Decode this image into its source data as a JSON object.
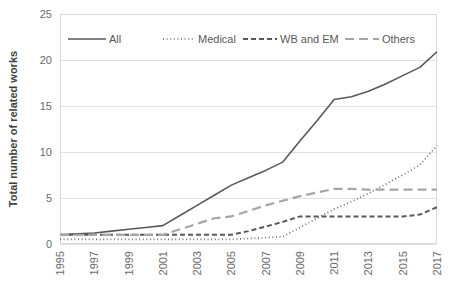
{
  "chart_data": {
    "type": "line",
    "title": "",
    "xlabel": "",
    "ylabel": "Total number of related works",
    "ylim": [
      0,
      25
    ],
    "yticks": [
      0,
      5,
      10,
      15,
      20,
      25
    ],
    "ytick_labels": [
      "0",
      "5",
      "10",
      "15",
      "20",
      "25"
    ],
    "grid": true,
    "legend_position": "top-inside",
    "x": [
      1995,
      1996,
      1997,
      1998,
      1999,
      2000,
      2001,
      2002,
      2003,
      2004,
      2005,
      2006,
      2007,
      2008,
      2009,
      2010,
      2011,
      2012,
      2013,
      2014,
      2015,
      2016,
      2017
    ],
    "xtick_labels": [
      "1995",
      "1997",
      "1999",
      "2001",
      "2003",
      "2005",
      "2007",
      "2009",
      "2011",
      "2013",
      "2015",
      "2017"
    ],
    "xtick_values": [
      1995,
      1997,
      1999,
      2001,
      2003,
      2005,
      2007,
      2009,
      2011,
      2013,
      2015,
      2017
    ],
    "series": [
      {
        "name": "All",
        "style": "solid",
        "color": "#595959",
        "values": [
          1,
          1.1,
          1.2,
          1.4,
          1.6,
          1.8,
          2,
          3.1,
          4.2,
          5.3,
          6.4,
          7.2,
          8,
          8.9,
          11.2,
          13.4,
          15.7,
          16,
          16.6,
          17.4,
          18.3,
          19.2,
          20.9
        ]
      },
      {
        "name": "Medical",
        "style": "dotted",
        "color": "#6e6e6e",
        "values": [
          0.5,
          0.5,
          0.5,
          0.5,
          0.5,
          0.5,
          0.5,
          0.5,
          0.5,
          0.5,
          0.5,
          0.6,
          0.7,
          0.8,
          1.8,
          2.8,
          3.8,
          4.6,
          5.5,
          6.5,
          7.5,
          8.6,
          10.7
        ]
      },
      {
        "name": "WB and EM",
        "style": "dashed",
        "color": "#595959",
        "values": [
          1,
          1,
          1,
          1,
          1,
          1,
          1,
          1,
          1,
          1,
          1,
          1.4,
          1.9,
          2.4,
          3,
          3,
          3,
          3,
          3,
          3,
          3,
          3.2,
          4
        ]
      },
      {
        "name": "Others",
        "style": "long-dash",
        "color": "#a6a6a6",
        "values": [
          1,
          1,
          1,
          1,
          1,
          1,
          1,
          1.6,
          2.2,
          2.8,
          3,
          3.6,
          4.2,
          4.7,
          5.2,
          5.6,
          6,
          6,
          5.9,
          5.9,
          5.9,
          5.9,
          5.9
        ]
      }
    ]
  },
  "legend": {
    "items": [
      {
        "label": "All"
      },
      {
        "label": "Medical"
      },
      {
        "label": "WB and EM"
      },
      {
        "label": "Others"
      }
    ]
  }
}
